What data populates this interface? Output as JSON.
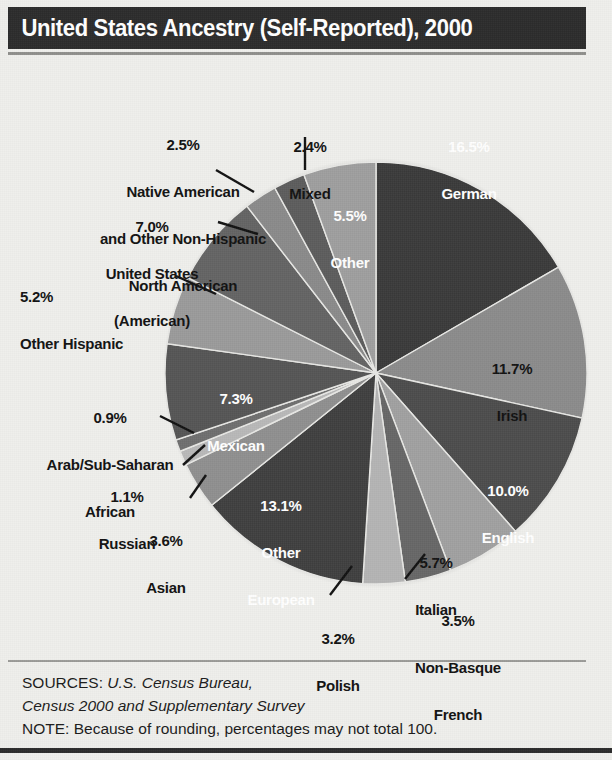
{
  "header": {
    "title": "United States Ancestry (Self-Reported), 2000"
  },
  "footer": {
    "sources_prefix": "SOURCES: ",
    "sources_italic_1": "U.S. Census Bureau,",
    "sources_italic_2": "Census 2000 and Supplementary Survey",
    "note": "NOTE: Because of rounding, percentages may not total 100."
  },
  "chart_data": {
    "type": "pie",
    "title": "United States Ancestry (Self-Reported), 2000",
    "unit": "percent",
    "total": 99.2,
    "start_angle_deg": 0,
    "direction": "clockwise",
    "categories": [
      "German",
      "Irish",
      "English",
      "Italian",
      "Non-Basque French",
      "Polish",
      "Other European",
      "Asian",
      "Russian",
      "Arab/Sub-Saharan African",
      "Mexican",
      "Other Hispanic",
      "United States (American)",
      "Native American and Other Non-Hispanic North American",
      "Mixed",
      "Other"
    ],
    "values": [
      16.5,
      11.7,
      10.0,
      5.7,
      3.5,
      3.2,
      13.1,
      3.6,
      1.1,
      0.9,
      7.3,
      5.2,
      7.0,
      2.5,
      2.4,
      5.5
    ],
    "colors": [
      "#3a3a3a",
      "#8b8b8b",
      "#4c4c4c",
      "#a0a0a0",
      "#666666",
      "#b4b4b4",
      "#3f3f3f",
      "#8f8f8f",
      "#b8b8b8",
      "#6e6e6e",
      "#555555",
      "#9a9a9a",
      "#636363",
      "#8a8a8a",
      "#5c5c5c",
      "#9e9e9e"
    ],
    "slices": [
      {
        "label": "German",
        "pct_text": "16.5%",
        "name_lines": [
          "German"
        ]
      },
      {
        "label": "Irish",
        "pct_text": "11.7%",
        "name_lines": [
          "Irish"
        ]
      },
      {
        "label": "English",
        "pct_text": "10.0%",
        "name_lines": [
          "English"
        ]
      },
      {
        "label": "Italian",
        "pct_text": "5.7%",
        "name_lines": [
          "Italian"
        ]
      },
      {
        "label": "Non-Basque French",
        "pct_text": "3.5%",
        "name_lines": [
          "Non-Basque",
          "French"
        ]
      },
      {
        "label": "Polish",
        "pct_text": "3.2%",
        "name_lines": [
          "Polish"
        ]
      },
      {
        "label": "Other European",
        "pct_text": "13.1%",
        "name_lines": [
          "Other",
          "European"
        ]
      },
      {
        "label": "Asian",
        "pct_text": "3.6%",
        "name_lines": [
          "Asian"
        ]
      },
      {
        "label": "Russian",
        "pct_text": "1.1%",
        "name_lines": [
          "Russian"
        ]
      },
      {
        "label": "Arab/Sub-Saharan African",
        "pct_text": "0.9%",
        "name_lines": [
          "Arab/Sub-Saharan",
          "African"
        ]
      },
      {
        "label": "Mexican",
        "pct_text": "7.3%",
        "name_lines": [
          "Mexican"
        ]
      },
      {
        "label": "Other Hispanic",
        "pct_text": "5.2%",
        "name_lines": [
          "Other Hispanic"
        ]
      },
      {
        "label": "United States (American)",
        "pct_text": "7.0%",
        "name_lines": [
          "United States",
          "(American)"
        ]
      },
      {
        "label": "Native American",
        "pct_text": "2.5%",
        "name_lines": [
          "Native American",
          "and Other Non-Hispanic",
          "North American"
        ]
      },
      {
        "label": "Mixed",
        "pct_text": "2.4%",
        "name_lines": [
          "Mixed"
        ]
      },
      {
        "label": "Other",
        "pct_text": "5.5%",
        "name_lines": [
          "Other"
        ]
      }
    ],
    "legend": "none",
    "grid": false
  },
  "labels": {
    "german": {
      "pct": "16.5%",
      "l1": "German"
    },
    "irish": {
      "pct": "11.7%",
      "l1": "Irish"
    },
    "english": {
      "pct": "10.0%",
      "l1": "English"
    },
    "italian": {
      "pct": "5.7%",
      "l1": "Italian"
    },
    "french": {
      "pct": "3.5%",
      "l1": "Non-Basque",
      "l2": "French"
    },
    "polish": {
      "pct": "3.2%",
      "l1": "Polish"
    },
    "other_european": {
      "pct": "13.1%",
      "l1": "Other",
      "l2": "European"
    },
    "asian": {
      "pct": "3.6%",
      "l1": "Asian"
    },
    "russian": {
      "pct": "1.1%",
      "l1": "Russian"
    },
    "arab": {
      "pct": "0.9%",
      "l1": "Arab/Sub-Saharan",
      "l2": "African"
    },
    "mexican": {
      "pct": "7.3%",
      "l1": "Mexican"
    },
    "other_hispanic": {
      "pct": "5.2%",
      "l1": "Other Hispanic"
    },
    "american": {
      "pct": "7.0%",
      "l1": "United States",
      "l2": "(American)"
    },
    "native": {
      "pct": "2.5%",
      "l1": "Native American",
      "l2": "and Other Non-Hispanic",
      "l3": "North American"
    },
    "mixed": {
      "pct": "2.4%",
      "l1": "Mixed"
    },
    "other": {
      "pct": "5.5%",
      "l1": "Other"
    }
  }
}
